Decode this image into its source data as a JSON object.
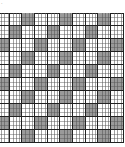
{
  "figure": {
    "corner_mark": "·"
  },
  "grid": {
    "rows": 10,
    "cols": 10,
    "cell_w": 12.67,
    "cell_h": 13.0,
    "colors": {
      "shaded": "#9a9a9a",
      "plain": "#ffffff",
      "line": "#222222"
    },
    "shaded_cells": [
      [
        0,
        2
      ],
      [
        0,
        5
      ],
      [
        0,
        8
      ],
      [
        1,
        1
      ],
      [
        1,
        4
      ],
      [
        1,
        7
      ],
      [
        2,
        0
      ],
      [
        2,
        3
      ],
      [
        2,
        6
      ],
      [
        2,
        9
      ],
      [
        3,
        2
      ],
      [
        3,
        5
      ],
      [
        3,
        8
      ],
      [
        4,
        1
      ],
      [
        4,
        4
      ],
      [
        4,
        7
      ],
      [
        5,
        0
      ],
      [
        5,
        3
      ],
      [
        5,
        6
      ],
      [
        5,
        9
      ],
      [
        6,
        2
      ],
      [
        6,
        5
      ],
      [
        6,
        8
      ],
      [
        7,
        1
      ],
      [
        7,
        4
      ],
      [
        7,
        7
      ],
      [
        8,
        0
      ],
      [
        8,
        3
      ],
      [
        8,
        6
      ],
      [
        8,
        9
      ],
      [
        9,
        2
      ],
      [
        9,
        5
      ],
      [
        9,
        8
      ]
    ],
    "sub_lines_per_cell": {
      "vertical": 4,
      "horizontal": 3
    }
  }
}
